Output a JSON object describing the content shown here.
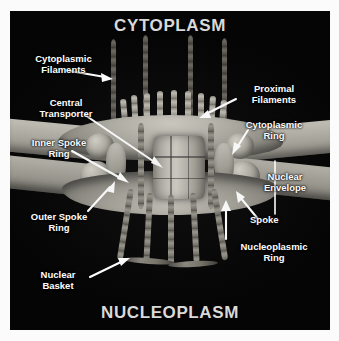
{
  "figure": {
    "kind": "nuclear-pore-complex-diagram",
    "background_color": "#050505",
    "frame_color": "#fbfbfb",
    "label_color": "#ffffff",
    "title_color": "#d9d9d9"
  },
  "zones": {
    "top": "CYTOPLASM",
    "bottom": "NUCLEOPLASM"
  },
  "labels": {
    "cytoplasmic_filaments": "Cytoplasmic\nFilaments",
    "central_transporter": "Central\nTransporter",
    "inner_spoke_ring": "Inner Spoke\nRing",
    "outer_spoke_ring": "Outer Spoke\nRing",
    "nuclear_basket": "Nuclear\nBasket",
    "proximal_filaments": "Proximal\nFilaments",
    "cytoplasmic_ring": "Cytoplasmic\nRing",
    "nuclear_envelope": "Nuclear\nEnvelope",
    "spoke": "Spoke",
    "nucleoplasmic_ring": "Nucleoplasmic\nRing"
  },
  "structures": {
    "central_transporter": "central-transporter",
    "cytoplasmic_ring": "cytoplasmic-ring",
    "nucleoplasmic_ring": "nucleoplasmic-ring",
    "nuclear_envelope": "nuclear-envelope-membrane",
    "spoke": "spoke",
    "outer_spoke_ring": "outer-spoke-ring",
    "inner_spoke_ring": "inner-spoke-ring",
    "cytoplasmic_filament": "cytoplasmic-filament",
    "proximal_filament": "proximal-filament",
    "nuclear_basket": "nuclear-basket"
  }
}
